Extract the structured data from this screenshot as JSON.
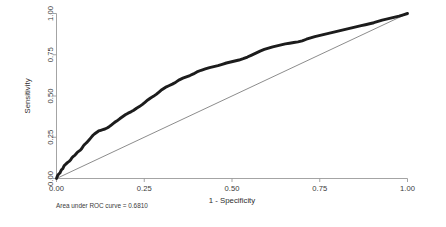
{
  "chart_data": {
    "type": "line",
    "title": "",
    "subtitle": "",
    "xlabel": "1 - Specificity",
    "ylabel": "Sensitivity",
    "xlim": [
      0,
      1
    ],
    "ylim": [
      0,
      1
    ],
    "grid": false,
    "legend_position": "none",
    "annotation": "Area under ROC curve = 0.6810",
    "auc": 0.681,
    "xticks": [
      0,
      0.25,
      0.5,
      0.75,
      1
    ],
    "xtick_labels": [
      "0.00",
      "0.25",
      "0.50",
      "0.75",
      "1.00"
    ],
    "yticks": [
      0,
      0.25,
      0.5,
      0.75,
      1
    ],
    "ytick_labels": [
      "0.00",
      "0.25",
      "0.50",
      "0.75",
      "1.00"
    ],
    "series": [
      {
        "name": "ROC curve",
        "color": "#1c1c1c",
        "x": [
          0.0,
          0.002,
          0.004,
          0.006,
          0.008,
          0.01,
          0.012,
          0.014,
          0.016,
          0.018,
          0.02,
          0.022,
          0.024,
          0.028,
          0.032,
          0.036,
          0.04,
          0.044,
          0.048,
          0.052,
          0.056,
          0.06,
          0.064,
          0.068,
          0.072,
          0.076,
          0.08,
          0.084,
          0.088,
          0.092,
          0.096,
          0.1,
          0.104,
          0.108,
          0.112,
          0.116,
          0.12,
          0.126,
          0.132,
          0.138,
          0.144,
          0.15,
          0.156,
          0.162,
          0.168,
          0.174,
          0.18,
          0.188,
          0.196,
          0.204,
          0.212,
          0.22,
          0.228,
          0.236,
          0.244,
          0.252,
          0.26,
          0.268,
          0.276,
          0.284,
          0.292,
          0.3,
          0.31,
          0.32,
          0.33,
          0.34,
          0.35,
          0.36,
          0.37,
          0.38,
          0.39,
          0.4,
          0.412,
          0.424,
          0.436,
          0.448,
          0.46,
          0.472,
          0.484,
          0.496,
          0.508,
          0.52,
          0.532,
          0.544,
          0.556,
          0.568,
          0.58,
          0.592,
          0.604,
          0.616,
          0.628,
          0.64,
          0.652,
          0.664,
          0.676,
          0.688,
          0.7,
          0.712,
          0.724,
          0.736,
          0.748,
          0.76,
          0.772,
          0.784,
          0.796,
          0.808,
          0.82,
          0.832,
          0.844,
          0.856,
          0.868,
          0.88,
          0.892,
          0.904,
          0.916,
          0.928,
          0.94,
          0.952,
          0.964,
          0.976,
          0.988,
          1.0
        ],
        "y": [
          0.0,
          0.012,
          0.02,
          0.026,
          0.03,
          0.034,
          0.044,
          0.052,
          0.056,
          0.06,
          0.07,
          0.078,
          0.082,
          0.09,
          0.098,
          0.104,
          0.112,
          0.126,
          0.134,
          0.14,
          0.15,
          0.16,
          0.166,
          0.172,
          0.182,
          0.196,
          0.206,
          0.214,
          0.222,
          0.232,
          0.242,
          0.252,
          0.262,
          0.27,
          0.276,
          0.282,
          0.288,
          0.292,
          0.296,
          0.3,
          0.306,
          0.314,
          0.324,
          0.334,
          0.344,
          0.352,
          0.362,
          0.374,
          0.386,
          0.396,
          0.404,
          0.414,
          0.426,
          0.436,
          0.448,
          0.462,
          0.476,
          0.488,
          0.498,
          0.51,
          0.524,
          0.538,
          0.552,
          0.562,
          0.572,
          0.584,
          0.598,
          0.608,
          0.616,
          0.624,
          0.634,
          0.646,
          0.656,
          0.664,
          0.672,
          0.678,
          0.684,
          0.692,
          0.7,
          0.706,
          0.712,
          0.718,
          0.726,
          0.736,
          0.748,
          0.76,
          0.772,
          0.782,
          0.79,
          0.798,
          0.804,
          0.81,
          0.816,
          0.82,
          0.824,
          0.828,
          0.834,
          0.844,
          0.852,
          0.86,
          0.866,
          0.872,
          0.878,
          0.884,
          0.89,
          0.896,
          0.902,
          0.908,
          0.914,
          0.92,
          0.926,
          0.932,
          0.938,
          0.944,
          0.952,
          0.96,
          0.966,
          0.972,
          0.978,
          0.984,
          0.992,
          1.0
        ]
      },
      {
        "name": "Reference line",
        "color": "#5a5a5a",
        "x": [
          0,
          1
        ],
        "y": [
          0,
          1
        ]
      }
    ]
  }
}
